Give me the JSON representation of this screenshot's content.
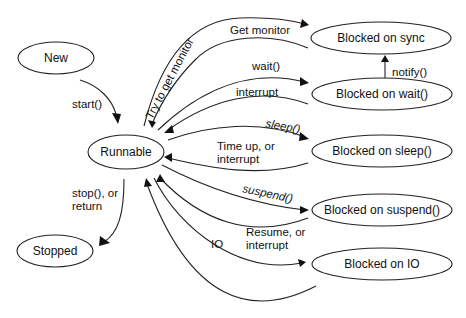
{
  "diagram": {
    "nodes": {
      "new": "New",
      "runnable": "Runnable",
      "stopped": "Stopped",
      "blocked_sync": "Blocked on sync",
      "blocked_wait": "Blocked on wait()",
      "blocked_sleep": "Blocked on sleep()",
      "blocked_suspend": "Blocked on suspend()",
      "blocked_io": "Blocked on IO"
    },
    "edges": {
      "start": "start()",
      "stop": "stop(), or",
      "stop2": "return",
      "try_monitor": "Try to get monitor",
      "get_monitor": "Get monitor",
      "wait": "wait()",
      "interrupt": "interrupt",
      "notify": "notify()",
      "sleep": "sleep()",
      "timeup1": "Time up, or",
      "timeup2": "interrupt",
      "suspend": "suspend()",
      "resume1": "Resume, or",
      "resume2": "interrupt",
      "io": "IO"
    }
  }
}
